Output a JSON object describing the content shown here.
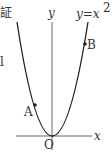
{
  "diagram": {
    "axes": {
      "x_label": "x",
      "y_label": "y",
      "origin_label": "O"
    },
    "curve": {
      "equation_lhs": "y=x",
      "equation_exp": "2"
    },
    "points": [
      {
        "label": "A"
      },
      {
        "label": "B"
      }
    ],
    "edge_fragments": [
      "証",
      "l"
    ]
  }
}
